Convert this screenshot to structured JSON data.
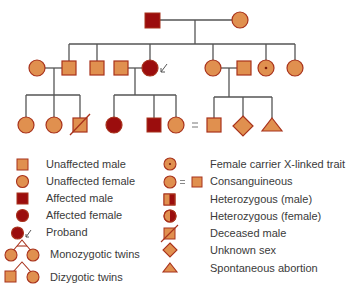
{
  "colors": {
    "unaffected_fill": "#e0904f",
    "affected_fill": "#9b0d0d",
    "stroke": "#a8321c",
    "line": "#555555",
    "text": "#3a3a3a"
  },
  "pedigree": {
    "generation_1": [
      {
        "sex": "male",
        "status": "affected"
      },
      {
        "sex": "female",
        "status": "unaffected"
      }
    ],
    "generation_2": [
      {
        "sex": "female",
        "status": "unaffected",
        "role": "spouse"
      },
      {
        "sex": "male",
        "status": "unaffected"
      },
      {
        "sex": "male",
        "status": "unaffected"
      },
      {
        "sex": "male",
        "status": "unaffected",
        "role": "spouse"
      },
      {
        "sex": "female",
        "status": "affected",
        "role": "proband"
      },
      {
        "sex": "female",
        "status": "unaffected"
      },
      {
        "sex": "male",
        "status": "unaffected",
        "role": "spouse"
      },
      {
        "sex": "female",
        "status": "carrier"
      },
      {
        "sex": "female",
        "status": "unaffected"
      }
    ],
    "generation_3": [
      {
        "sex": "female",
        "status": "unaffected"
      },
      {
        "sex": "female",
        "status": "unaffected"
      },
      {
        "sex": "male",
        "status": "deceased"
      },
      {
        "sex": "female",
        "status": "affected"
      },
      {
        "sex": "male",
        "status": "affected"
      },
      {
        "sex": "female",
        "status": "unaffected"
      },
      {
        "sex": "male",
        "status": "unaffected"
      },
      {
        "sex": "unknown",
        "status": "unaffected"
      },
      {
        "sex": "none",
        "status": "spontaneous_abortion"
      }
    ],
    "consanguinity_symbol": "="
  },
  "legend": {
    "left": [
      {
        "icon": "unaffected-male-icon",
        "label": "Unaffected male"
      },
      {
        "icon": "unaffected-female-icon",
        "label": "Unaffected female"
      },
      {
        "icon": "affected-male-icon",
        "label": "Affected male"
      },
      {
        "icon": "affected-female-icon",
        "label": "Affected female"
      },
      {
        "icon": "proband-icon",
        "label": "Proband"
      },
      {
        "icon": "monozygotic-twins-icon",
        "label": "Monozygotic twins"
      },
      {
        "icon": "dizygotic-twins-icon",
        "label": "Dizygotic twins"
      }
    ],
    "right": [
      {
        "icon": "female-carrier-icon",
        "label": "Female carrier X-linked trait"
      },
      {
        "icon": "consanguineous-icon",
        "label": "Consanguineous",
        "symbol": "="
      },
      {
        "icon": "heterozygous-male-icon",
        "label": "Heterozygous (male)"
      },
      {
        "icon": "heterozygous-female-icon",
        "label": "Heterozygous (female)"
      },
      {
        "icon": "deceased-male-icon",
        "label": "Deceased male"
      },
      {
        "icon": "unknown-sex-icon",
        "label": "Unknown sex"
      },
      {
        "icon": "spontaneous-abortion-icon",
        "label": "Spontaneous abortion"
      }
    ]
  }
}
